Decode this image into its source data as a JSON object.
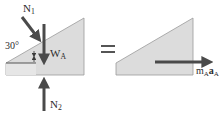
{
  "diagram": {
    "type": "free-body-diagram",
    "equals_sign": "=",
    "left_body": {
      "name": "wedge A",
      "fill": "#dcdcdc",
      "edge": "#9a9a9a",
      "angle_label": "30°",
      "forces": [
        {
          "id": "N1",
          "label": "N",
          "sub": "1",
          "direction": "down-right, normal to incline"
        },
        {
          "id": "WA",
          "label": "W",
          "sub": "A",
          "direction": "down"
        },
        {
          "id": "N2",
          "label": "N",
          "sub": "2",
          "direction": "up"
        }
      ]
    },
    "right_body": {
      "name": "wedge A (kinetic diagram)",
      "fill": "#dcdcdc",
      "edge": "#9a9a9a",
      "vectors": [
        {
          "id": "mAaA",
          "label_m": "m",
          "sub_m": "A",
          "label_a": "a",
          "sub_a": "A",
          "direction": "right"
        }
      ]
    },
    "colors": {
      "arrow": "#4a4a4a",
      "text": "#2b2b2b"
    }
  }
}
